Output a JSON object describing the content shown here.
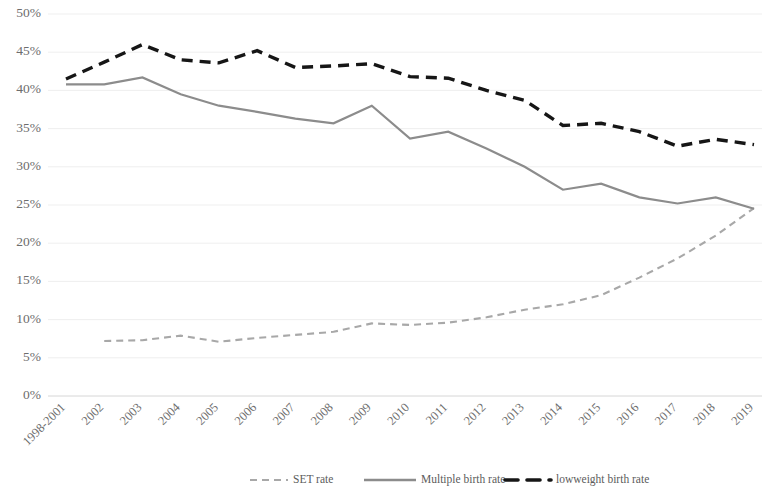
{
  "chart_data": {
    "type": "line",
    "title": "",
    "xlabel": "",
    "ylabel": "",
    "ylim": [
      0,
      50
    ],
    "y_tick_step": 5,
    "grid": true,
    "legend_position": "bottom",
    "y_tick_labels": [
      "0%",
      "5%",
      "10%",
      "15%",
      "20%",
      "25%",
      "30%",
      "35%",
      "40%",
      "45%",
      "50%"
    ],
    "y_tick_values": [
      0,
      5,
      10,
      15,
      20,
      25,
      30,
      35,
      40,
      45,
      50
    ],
    "categories": [
      "1998-2001",
      "2002",
      "2003",
      "2004",
      "2005",
      "2006",
      "2007",
      "2008",
      "2009",
      "2010",
      "2011",
      "2012",
      "2013",
      "2014",
      "2015",
      "2016",
      "2017",
      "2018",
      "2019"
    ],
    "series": [
      {
        "name": "SET rate",
        "color": "#a8a8a8",
        "style": "dashed",
        "width": 2.1,
        "dash": "7,5",
        "values": [
          null,
          7.2,
          7.3,
          7.9,
          7.1,
          7.6,
          8.0,
          8.4,
          9.5,
          9.3,
          9.6,
          10.3,
          11.3,
          12.0,
          13.2,
          15.5,
          18.0,
          21.0,
          24.6
        ]
      },
      {
        "name": "Multiple birth rate",
        "color": "#8c8c8c",
        "style": "solid",
        "width": 2.2,
        "dash": "",
        "values": [
          40.8,
          40.8,
          41.7,
          39.5,
          38.0,
          37.2,
          36.3,
          35.7,
          38.0,
          33.7,
          34.6,
          32.4,
          30.0,
          27.0,
          27.8,
          26.0,
          25.2,
          26.0,
          24.5
        ]
      },
      {
        "name": "lowweight birth rate",
        "color": "#161616",
        "style": "dashed-bold",
        "width": 3.4,
        "dash": "11,7",
        "values": [
          41.5,
          43.7,
          46.0,
          44.0,
          43.6,
          45.2,
          43.0,
          43.2,
          43.5,
          41.8,
          41.6,
          40.0,
          38.7,
          35.4,
          35.7,
          34.6,
          32.7,
          33.6,
          32.9
        ]
      }
    ]
  },
  "legend": {
    "items": [
      {
        "label": "SET rate",
        "color": "#a8a8a8",
        "style": "dashed"
      },
      {
        "label": "Multiple birth rate",
        "color": "#8c8c8c",
        "style": "solid"
      },
      {
        "label": "lowweight birth rate",
        "color": "#161616",
        "style": "dashed-bold"
      }
    ]
  }
}
